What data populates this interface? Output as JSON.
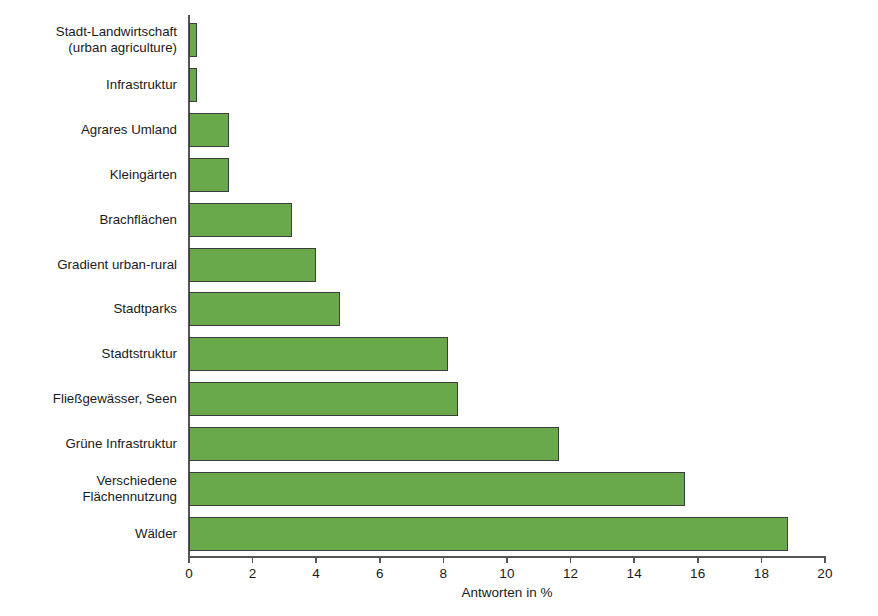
{
  "chart_data": {
    "type": "bar",
    "orientation": "horizontal",
    "title": "",
    "xlabel": "Antworten in %",
    "ylabel": "",
    "xlim": [
      0,
      20
    ],
    "xticks": [
      0,
      2,
      4,
      6,
      8,
      10,
      12,
      14,
      16,
      18,
      20
    ],
    "grid": false,
    "legend": null,
    "bar_color": "#6aa84c",
    "bar_edge_color": "#3c3c3c",
    "categories": [
      "Stadt-Landwirtschaft\n(urban agriculture)",
      "Infrastruktur",
      "Agrares Umland",
      "Kleingärten",
      "Brachflächen",
      "Gradient urban-rural",
      "Stadtparks",
      "Stadtstruktur",
      "Fließgewässer, Seen",
      "Grüne Infrastruktur",
      "Verschiedene\nFlächennutzung",
      "Wälder"
    ],
    "values": [
      0.25,
      0.25,
      1.25,
      1.25,
      3.25,
      4.0,
      4.75,
      8.15,
      8.45,
      11.65,
      15.6,
      18.85
    ]
  }
}
